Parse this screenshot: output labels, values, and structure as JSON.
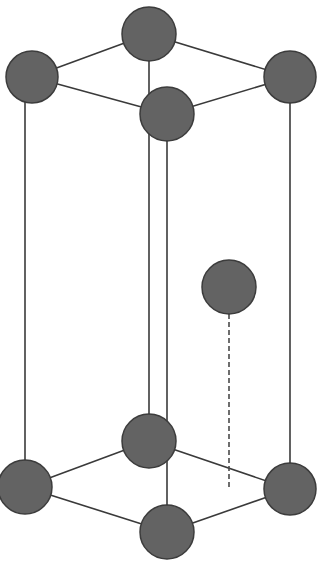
{
  "diagram": {
    "type": "crystal-unit-cell",
    "colors": {
      "background": "#ffffff",
      "atom_fill": "#636363",
      "atom_stroke": "#3c3c3c",
      "edge": "#3a3a3a",
      "dashed": "#4a4a4a"
    },
    "atoms": [
      {
        "id": "top-back",
        "cx": 149,
        "cy": 34,
        "r": 27
      },
      {
        "id": "top-left",
        "cx": 32,
        "cy": 77,
        "r": 26
      },
      {
        "id": "top-right",
        "cx": 290,
        "cy": 77,
        "r": 26
      },
      {
        "id": "top-front",
        "cx": 167,
        "cy": 114,
        "r": 27
      },
      {
        "id": "interior",
        "cx": 229,
        "cy": 287,
        "r": 27
      },
      {
        "id": "bottom-back",
        "cx": 149,
        "cy": 441,
        "r": 27
      },
      {
        "id": "bottom-left",
        "cx": 25,
        "cy": 487,
        "r": 27
      },
      {
        "id": "bottom-right",
        "cx": 290,
        "cy": 489,
        "r": 26
      },
      {
        "id": "bottom-front",
        "cx": 167,
        "cy": 532,
        "r": 27
      }
    ],
    "edges": [
      {
        "from": "top-back",
        "to": "top-left"
      },
      {
        "from": "top-back",
        "to": "top-right"
      },
      {
        "from": "top-left",
        "to": "top-front"
      },
      {
        "from": "top-right",
        "to": "top-front"
      },
      {
        "from": "bottom-back",
        "to": "bottom-left"
      },
      {
        "from": "bottom-back",
        "to": "bottom-right"
      },
      {
        "from": "bottom-left",
        "to": "bottom-front"
      },
      {
        "from": "bottom-right",
        "to": "bottom-front"
      },
      {
        "x1": 25,
        "y1": 100,
        "x2": 25,
        "y2": 487,
        "label": "left-vertical"
      },
      {
        "x1": 149,
        "y1": 34,
        "x2": 149,
        "y2": 441,
        "label": "back-vertical"
      },
      {
        "x1": 167,
        "y1": 114,
        "x2": 167,
        "y2": 532,
        "label": "front-vertical"
      },
      {
        "x1": 290,
        "y1": 77,
        "x2": 290,
        "y2": 489,
        "label": "right-vertical"
      }
    ],
    "dashed_projection": {
      "x1": 229,
      "y1": 314,
      "x2": 229,
      "y2": 488
    }
  }
}
